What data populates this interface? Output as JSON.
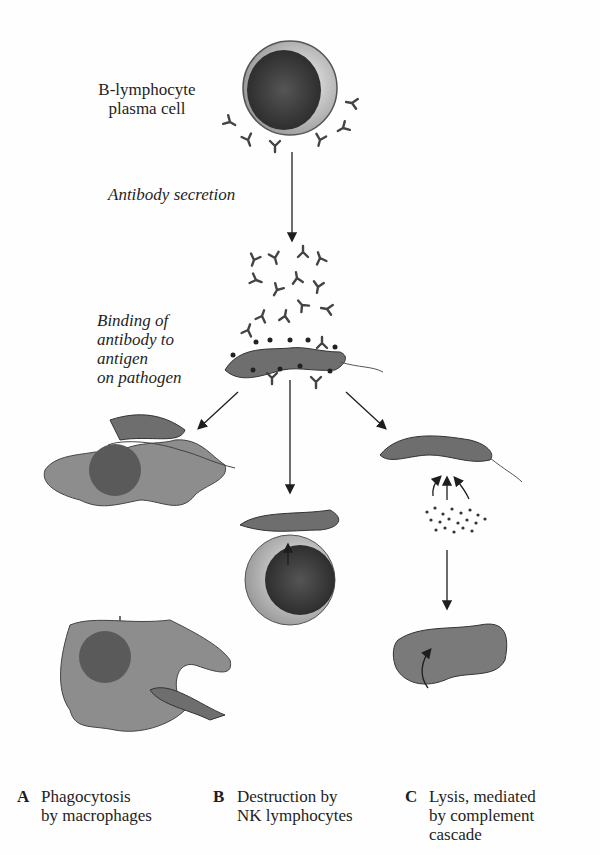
{
  "labels": {
    "source_cell": "B-lymphocyte\nplasma cell",
    "source_cell_line1": "B-lymphocyte",
    "source_cell_line2": "plasma cell",
    "step1": "Antibody secretion",
    "step2_line1": "Binding of",
    "step2_line2": "antibody to",
    "step2_line3": "antigen",
    "step2_line4": "on pathogen"
  },
  "outcomes": [
    {
      "letter": "A",
      "line1": "Phagocytosis",
      "line2": "by macrophages",
      "line3": ""
    },
    {
      "letter": "B",
      "line1": "Destruction by",
      "line2": "NK lymphocytes",
      "line3": ""
    },
    {
      "letter": "C",
      "line1": "Lysis, mediated",
      "line2": "by complement",
      "line3": "cascade"
    }
  ],
  "colors": {
    "background": "#fefefe",
    "ink": "#1e1e1e",
    "cell_body": "#8a8a8a",
    "nucleus": "#3a3a3a",
    "cytoplasm_light": "#d8d8d8"
  }
}
